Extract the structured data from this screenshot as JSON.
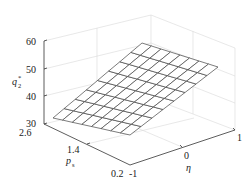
{
  "chart_data": {
    "type": "surface",
    "title": "",
    "xlabel": "η",
    "ylabel": "p_s",
    "zlabel": "q_2^*",
    "x_ticks": [
      "-1",
      "0",
      "1"
    ],
    "y_ticks": [
      "0.2",
      "1.4",
      "2.6"
    ],
    "z_ticks": [
      "30",
      "40",
      "50",
      "60"
    ],
    "xlim": [
      -1,
      1
    ],
    "ylim": [
      0.2,
      2.6
    ],
    "zlim": [
      30,
      60
    ],
    "grid": true,
    "mesh_size": [
      9,
      9
    ],
    "corner_values": {
      "eta_-1_ps_2.6": 31,
      "eta_-1_ps_0.2": 43,
      "eta_1_ps_0.2": 55,
      "eta_1_ps_2.6": 57
    }
  },
  "labels": {
    "z_axis": "q",
    "z_sub": "2",
    "z_sup": "*",
    "y_axis": "p",
    "y_sub": "s",
    "x_axis": "η"
  },
  "ticks": {
    "z": [
      "60",
      "50",
      "40",
      "30"
    ],
    "y": [
      "2.6",
      "1.4",
      "0.2"
    ],
    "x": [
      "-1",
      "0",
      "1"
    ]
  }
}
